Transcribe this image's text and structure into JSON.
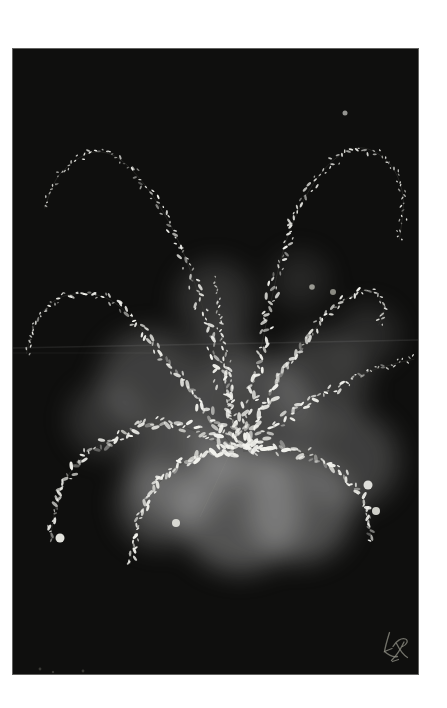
{
  "artwork": {
    "palette": {
      "page_bg": "#ffffff",
      "canvas_bg": "#0f0f0e",
      "dab_color": "#f3f3ee",
      "stem_color": "#3f3f39",
      "smoke_color": "#bbbbbb",
      "streak_color": "#ffffff",
      "scratch_color": "#999990",
      "signature_color": "#8b8b81",
      "dim_dot_color": "#4a4a44"
    },
    "canvas": {
      "x": 13,
      "y": 49,
      "width": 405,
      "height": 625
    },
    "seed": 11,
    "fronds": [
      {
        "name": "tall-left-arc",
        "points": [
          [
            226,
            398
          ],
          [
            192,
            266
          ],
          [
            159,
            179
          ],
          [
            117,
            119
          ],
          [
            82,
            103
          ],
          [
            47,
            125
          ],
          [
            31,
            161
          ]
        ],
        "spread": 8,
        "size": 3.0,
        "spacing": 3.6,
        "taper": 0.8
      },
      {
        "name": "tall-right-arc",
        "points": [
          [
            230,
            390
          ],
          [
            255,
            266
          ],
          [
            277,
            181
          ],
          [
            309,
            123
          ],
          [
            344,
            99
          ],
          [
            375,
            113
          ],
          [
            390,
            147
          ],
          [
            386,
            193
          ]
        ],
        "spread": 8,
        "size": 3.0,
        "spacing": 3.6,
        "taper": 0.8
      },
      {
        "name": "mid-left-frond",
        "points": [
          [
            220,
            398
          ],
          [
            157,
            316
          ],
          [
            102,
            254
          ],
          [
            55,
            246
          ],
          [
            25,
            269
          ],
          [
            13,
            306
          ]
        ],
        "spread": 6.5,
        "size": 3.2,
        "spacing": 3.3,
        "taper": 0.7
      },
      {
        "name": "mid-right-upper-frond",
        "points": [
          [
            232,
            388
          ],
          [
            287,
            299
          ],
          [
            332,
            251
          ],
          [
            359,
            242
          ],
          [
            371,
            261
          ],
          [
            365,
            277
          ]
        ],
        "spread": 7,
        "size": 3.3,
        "spacing": 3.2,
        "taper": 0.7
      },
      {
        "name": "right-horizontal-frond",
        "points": [
          [
            234,
            398
          ],
          [
            295,
            355
          ],
          [
            345,
            327
          ],
          [
            381,
            315
          ],
          [
            402,
            310
          ]
        ],
        "spread": 7,
        "size": 3.3,
        "spacing": 3.2,
        "taper": 0.8
      },
      {
        "name": "lower-right-droop",
        "points": [
          [
            230,
            402
          ],
          [
            287,
            403
          ],
          [
            332,
            428
          ],
          [
            353,
            459
          ],
          [
            358,
            493
          ]
        ],
        "spread": 7.5,
        "size": 3.4,
        "spacing": 3.0,
        "taper": 0.45
      },
      {
        "name": "lower-left-droop",
        "points": [
          [
            222,
            402
          ],
          [
            152,
            374
          ],
          [
            82,
            399
          ],
          [
            49,
            438
          ],
          [
            37,
            491
          ]
        ],
        "spread": 7.5,
        "size": 3.4,
        "spacing": 3.0,
        "taper": 0.45
      },
      {
        "name": "lower-center-left-droop",
        "points": [
          [
            224,
            404
          ],
          [
            183,
            407
          ],
          [
            143,
            437
          ],
          [
            125,
            475
          ],
          [
            117,
            516
          ]
        ],
        "spread": 7,
        "size": 3.4,
        "spacing": 3.0,
        "taper": 0.45
      },
      {
        "name": "central-stem",
        "points": [
          [
            222,
            388
          ],
          [
            215,
            331
          ],
          [
            207,
            271
          ],
          [
            202,
            226
          ]
        ],
        "spread": 5,
        "size": 2.8,
        "spacing": 3.4,
        "taper": 0.75
      }
    ],
    "smoke": [
      {
        "x": 202,
        "y": 251,
        "r": 38,
        "opacity": 0.2
      },
      {
        "x": 287,
        "y": 231,
        "r": 28,
        "opacity": 0.14
      },
      {
        "x": 137,
        "y": 331,
        "r": 50,
        "opacity": 0.28
      },
      {
        "x": 92,
        "y": 371,
        "r": 36,
        "opacity": 0.2
      },
      {
        "x": 237,
        "y": 371,
        "r": 65,
        "opacity": 0.32
      },
      {
        "x": 307,
        "y": 331,
        "r": 48,
        "opacity": 0.24
      },
      {
        "x": 355,
        "y": 286,
        "r": 30,
        "opacity": 0.16
      },
      {
        "x": 337,
        "y": 411,
        "r": 48,
        "opacity": 0.28
      },
      {
        "x": 167,
        "y": 421,
        "r": 52,
        "opacity": 0.32
      },
      {
        "x": 147,
        "y": 455,
        "r": 42,
        "opacity": 0.32
      },
      {
        "x": 227,
        "y": 461,
        "r": 62,
        "opacity": 0.4
      },
      {
        "x": 287,
        "y": 461,
        "r": 52,
        "opacity": 0.38
      },
      {
        "x": 210,
        "y": 301,
        "r": 30,
        "opacity": 0.18
      }
    ],
    "streaks": [
      {
        "x1": 0,
        "y1": 299,
        "x2": 405,
        "y2": 291,
        "opacity": 0.08,
        "width": 1.4
      },
      {
        "x1": 0,
        "y1": 304,
        "x2": 140,
        "y2": 304,
        "opacity": 0.05,
        "width": 1.2
      }
    ],
    "scratch": {
      "x1": 220,
      "y1": 398,
      "x2": 187,
      "y2": 468,
      "opacity": 0.18,
      "width": 0.8
    },
    "highlights": [
      {
        "x": 355,
        "y": 436,
        "r": 4.5,
        "color": "#dededa"
      },
      {
        "x": 363,
        "y": 462,
        "r": 4.0,
        "color": "#cfcfc8"
      },
      {
        "x": 47,
        "y": 489,
        "r": 4.5,
        "color": "#e2e2dc"
      },
      {
        "x": 163,
        "y": 474,
        "r": 4.0,
        "color": "#d8d8d2"
      },
      {
        "x": 299,
        "y": 238,
        "r": 2.8,
        "color": "#9a9a93"
      },
      {
        "x": 320,
        "y": 243,
        "r": 3.0,
        "color": "#8a8a82"
      },
      {
        "x": 332,
        "y": 64,
        "r": 2.5,
        "color": "#949490"
      }
    ],
    "dim_dots": [
      {
        "x": 27,
        "y": 620,
        "r": 1.4
      },
      {
        "x": 40,
        "y": 623,
        "r": 1.2
      },
      {
        "x": 70,
        "y": 622,
        "r": 1.4
      }
    ],
    "signature": {
      "stroke_width": 1.3,
      "opacity": 0.8,
      "paths": [
        "M376.5 583.5 C374.5 590 372.5 596.5 371.5 602.5 L379 599.5",
        "M371.5 602.5 C376 606.5 380.5 608.5 384.5 607.5",
        "M380 597.5 C383 592 388.5 588.5 392.5 590 C396 591.5 393.5 596 389.5 597.5",
        "M383.5 594.5 C387 601.5 390.5 606 394.5 608.5",
        "M391 593 C387.5 600.5 383 607 378.5 611.5",
        "M379.5 612.5 L385.5 610.5"
      ]
    }
  }
}
